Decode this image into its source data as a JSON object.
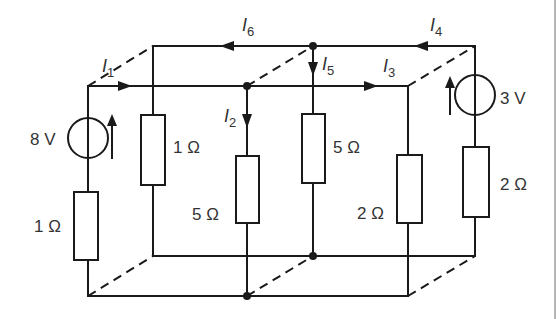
{
  "diagram": {
    "type": "3D resistive circuit network (cube-like box)",
    "sources": [
      {
        "id": "V1",
        "label": "8 V",
        "position": "front-left branch",
        "direction": "up"
      },
      {
        "id": "V2",
        "label": "3 V",
        "position": "back-right branch",
        "direction": "up"
      }
    ],
    "resistors": [
      {
        "id": "R_fl",
        "label": "1 Ω",
        "position": "front-left branch, below 8 V source"
      },
      {
        "id": "R_bl",
        "label": "1 Ω",
        "position": "back-left branch"
      },
      {
        "id": "R_fm",
        "label": "5 Ω",
        "position": "front-middle branch"
      },
      {
        "id": "R_bm",
        "label": "5 Ω",
        "position": "back-middle branch"
      },
      {
        "id": "R_fr",
        "label": "2 Ω",
        "position": "front-right branch"
      },
      {
        "id": "R_br",
        "label": "2 Ω",
        "position": "back-right branch, below 3 V source"
      }
    ],
    "currents": [
      {
        "id": "I1",
        "letter": "I",
        "sub": "1",
        "direction": "right along front top rail"
      },
      {
        "id": "I2",
        "letter": "I",
        "sub": "2",
        "direction": "down in front-middle branch"
      },
      {
        "id": "I3",
        "letter": "I",
        "sub": "3",
        "direction": "right along front top rail"
      },
      {
        "id": "I4",
        "letter": "I",
        "sub": "4",
        "direction": "left along back top rail"
      },
      {
        "id": "I5",
        "letter": "I",
        "sub": "5",
        "direction": "down in back-middle branch"
      },
      {
        "id": "I6",
        "letter": "I",
        "sub": "6",
        "direction": "left along back top rail"
      }
    ]
  }
}
